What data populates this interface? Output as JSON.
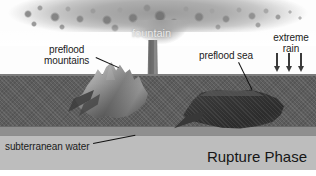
{
  "diagram": {
    "title": "Rupture Phase",
    "labels": {
      "fountain": "fountain",
      "preflood_mountains_line1": "preflood",
      "preflood_mountains_line2": "mountains",
      "preflood_sea": "preflood sea",
      "extreme_rain_line1": "extreme",
      "extreme_rain_line2": "rain",
      "subterranean_water": "subterranean water"
    },
    "icons": {
      "rain_arrow": "down-arrow-icon",
      "rain_arrow_count": 3
    },
    "colors": {
      "sky": "#fdfdfd",
      "crust": "#5d5d5d",
      "crust_lip": "#7c7c7c",
      "band_light": "#8f8f8f",
      "subterranean_water": "#bdbdbd",
      "sea": "#333333",
      "mountains": "#9a9a9a",
      "fountain_column": "#7a7a7a",
      "plume": "#9c9c9c",
      "label_text": "#1b1b1b",
      "fountain_text": "#e8e8e8"
    }
  }
}
